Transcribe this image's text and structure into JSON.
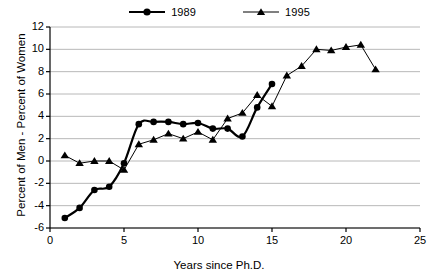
{
  "chart_data": {
    "type": "line",
    "title": "",
    "subtitle": "",
    "xlabel": "Years since Ph.D.",
    "ylabel": "Percent of Men - Percent of Women",
    "xlim": [
      0,
      25
    ],
    "ylim": [
      -6,
      12
    ],
    "xticks": [
      0,
      5,
      10,
      15,
      20,
      25
    ],
    "yticks": [
      -6,
      -4,
      -2,
      0,
      2,
      4,
      6,
      8,
      10,
      12
    ],
    "xtick_labels": [
      "0",
      "5",
      "10",
      "15",
      "20",
      "25"
    ],
    "ytick_labels": [
      "-6",
      "-4",
      "-2",
      "0",
      "2",
      "4",
      "6",
      "8",
      "10",
      "12"
    ],
    "grid": "horizontal",
    "legend_position": "top-center",
    "series": [
      {
        "name": "1989",
        "marker": "circle",
        "color": "#000000",
        "line_width": 2.2,
        "x": [
          1,
          2,
          3,
          4,
          5,
          6,
          7,
          8,
          9,
          10,
          11,
          12,
          13,
          14,
          15
        ],
        "values": [
          -5.1,
          -4.2,
          -2.6,
          -2.3,
          -0.2,
          3.3,
          3.5,
          3.5,
          3.3,
          3.4,
          2.9,
          2.9,
          2.2,
          4.8,
          6.9
        ]
      },
      {
        "name": "1995",
        "marker": "triangle",
        "color": "#000000",
        "line_width": 1.0,
        "x": [
          1,
          2,
          3,
          4,
          5,
          6,
          7,
          8,
          9,
          10,
          11,
          12,
          13,
          14,
          15,
          16,
          17,
          18,
          19,
          20,
          21,
          22
        ],
        "values": [
          0.5,
          -0.2,
          0.0,
          0.0,
          -0.8,
          1.5,
          1.9,
          2.45,
          2.0,
          2.6,
          1.9,
          3.8,
          4.3,
          5.9,
          4.9,
          7.65,
          8.5,
          10.0,
          9.9,
          10.2,
          10.4,
          8.2
        ]
      }
    ]
  },
  "legend": {
    "entries": [
      {
        "label": "1989"
      },
      {
        "label": "1995"
      }
    ]
  },
  "colors": {
    "axis": "#000000",
    "grid": "#b8b8b8",
    "series_1989": "#000000",
    "series_1995": "#000000",
    "background": "#ffffff"
  }
}
